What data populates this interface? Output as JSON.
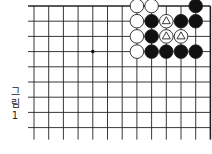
{
  "figure": {
    "caption_lines": [
      "그",
      "림",
      "1"
    ]
  },
  "board": {
    "columns": 13,
    "rows": 9,
    "top_edge": true,
    "right_edge": true,
    "star_points": [
      [
        4,
        3
      ]
    ],
    "stones": [
      {
        "col": 7,
        "row": 0,
        "color": "white"
      },
      {
        "col": 8,
        "row": 0,
        "color": "white"
      },
      {
        "col": 11,
        "row": 0,
        "color": "black"
      },
      {
        "col": 7,
        "row": 1,
        "color": "white"
      },
      {
        "col": 8,
        "row": 1,
        "color": "black"
      },
      {
        "col": 9,
        "row": 1,
        "color": "white",
        "mark": "triangle"
      },
      {
        "col": 10,
        "row": 1,
        "color": "black"
      },
      {
        "col": 11,
        "row": 1,
        "color": "black"
      },
      {
        "col": 7,
        "row": 2,
        "color": "white"
      },
      {
        "col": 8,
        "row": 2,
        "color": "black"
      },
      {
        "col": 9,
        "row": 2,
        "color": "white",
        "mark": "triangle"
      },
      {
        "col": 10,
        "row": 2,
        "color": "white",
        "mark": "triangle"
      },
      {
        "col": 7,
        "row": 3,
        "color": "white"
      },
      {
        "col": 8,
        "row": 3,
        "color": "black"
      },
      {
        "col": 9,
        "row": 3,
        "color": "black"
      },
      {
        "col": 10,
        "row": 3,
        "color": "black"
      },
      {
        "col": 11,
        "row": 3,
        "color": "black"
      }
    ]
  }
}
